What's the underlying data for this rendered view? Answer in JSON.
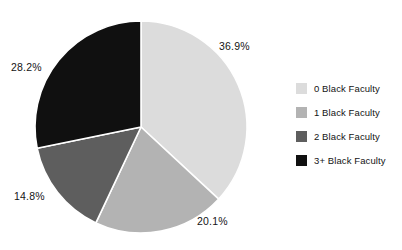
{
  "chart_data": {
    "type": "pie",
    "title": "",
    "categories": [
      "0 Black Faculty",
      "1 Black Faculty",
      "2 Black Faculty",
      "3+ Black Faculty"
    ],
    "values": [
      36.9,
      20.1,
      14.8,
      28.2
    ],
    "value_labels": [
      "36.9%",
      "20.1%",
      "14.8%",
      "28.2%"
    ],
    "units": "percent",
    "total": 100.0,
    "start_angle_deg": 0,
    "direction": "clockwise",
    "legend_position": "right",
    "grid": false,
    "colors": [
      "#dcdcdc",
      "#b3b3b3",
      "#5e5e5e",
      "#101010"
    ],
    "slice_border_color": "#ffffff",
    "background_color": "#ffffff",
    "label_color": "#141414",
    "slices": [
      {
        "label": "0 Black Faculty",
        "value": 36.9,
        "display": "36.9%",
        "color": "#dcdcdc"
      },
      {
        "label": "1 Black Faculty",
        "value": 20.1,
        "display": "20.1%",
        "color": "#b3b3b3"
      },
      {
        "label": "2 Black Faculty",
        "value": 14.8,
        "display": "14.8%",
        "color": "#5e5e5e"
      },
      {
        "label": "3+ Black Faculty",
        "value": 28.2,
        "display": "28.2%",
        "color": "#101010"
      }
    ]
  },
  "labels": {
    "slice_0": "36.9%",
    "slice_1": "20.1%",
    "slice_2": "14.8%",
    "slice_3": "28.2%"
  },
  "legend": {
    "items": [
      {
        "label": "0 Black Faculty",
        "color": "#dcdcdc"
      },
      {
        "label": "1 Black Faculty",
        "color": "#b3b3b3"
      },
      {
        "label": "2 Black Faculty",
        "color": "#5e5e5e"
      },
      {
        "label": "3+ Black Faculty",
        "color": "#101010"
      }
    ]
  }
}
